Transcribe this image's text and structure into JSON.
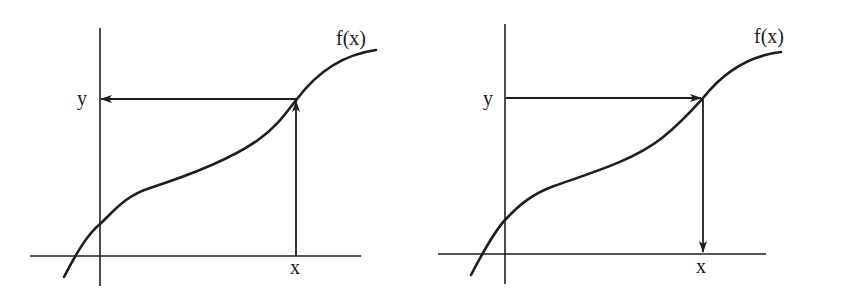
{
  "figure": {
    "colors": {
      "ink": "#1e1e1e",
      "background": "#ffffff"
    },
    "panels": [
      {
        "id": "forward",
        "curve_label": "f(x)",
        "y_label": "y",
        "x_label": "x",
        "arrows": [
          {
            "from": "x",
            "direction": "up",
            "meaning": "x to curve"
          },
          {
            "from": "curve",
            "direction": "left",
            "meaning": "curve to y"
          }
        ]
      },
      {
        "id": "inverse",
        "curve_label": "f(x)",
        "y_label": "y",
        "x_label": "x",
        "arrows": [
          {
            "from": "y",
            "direction": "right",
            "meaning": "y to curve"
          },
          {
            "from": "curve",
            "direction": "down",
            "meaning": "curve to x"
          }
        ]
      }
    ]
  }
}
